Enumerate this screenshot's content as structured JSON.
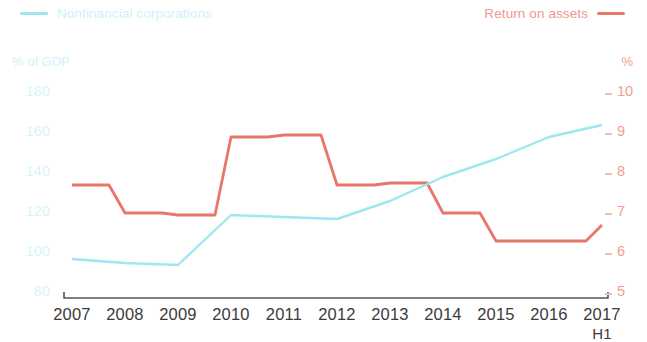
{
  "legend": {
    "left": {
      "label": "Nonfinancial corporations",
      "color": "#9ce7f0"
    },
    "right": {
      "label": "Return on assets",
      "color": "#e8776a"
    }
  },
  "axes": {
    "y_left": {
      "title": "% of GDP",
      "ticks": [
        "180",
        "160",
        "140",
        "120",
        "100",
        "80"
      ],
      "color": "#cdf3f7"
    },
    "y_right": {
      "title": "%",
      "ticks": [
        "10",
        "9",
        "8",
        "7",
        "6",
        "5"
      ],
      "color": "#ef9f8d"
    },
    "x": {
      "labels": [
        "2007",
        "2008",
        "2009",
        "2010",
        "2011",
        "2012",
        "2013",
        "2014",
        "2015",
        "2016",
        "2017"
      ],
      "sublabel": "H1"
    }
  },
  "chart_data": {
    "type": "line",
    "title": "",
    "xlabel": "",
    "grid": false,
    "legend_position": "top",
    "x": [
      "2007",
      "2008",
      "2009",
      "2010",
      "2011",
      "2012",
      "2013",
      "2014",
      "2015",
      "2016",
      "2017 H1"
    ],
    "series": [
      {
        "name": "Nonfinancial corporations",
        "color": "#9ce7f0",
        "axis": "left",
        "ylabel": "% of GDP",
        "ylim": [
          80,
          180
        ],
        "values": [
          97,
          95,
          94,
          119,
          118,
          117,
          126,
          138,
          147,
          158,
          164
        ]
      },
      {
        "name": "Return on assets",
        "color": "#e8776a",
        "axis": "right",
        "ylabel": "%",
        "ylim": [
          5,
          10
        ],
        "values": [
          7.7,
          7.0,
          6.95,
          8.9,
          8.95,
          7.7,
          7.75,
          7.0,
          6.3,
          6.3,
          6.7
        ]
      }
    ]
  }
}
